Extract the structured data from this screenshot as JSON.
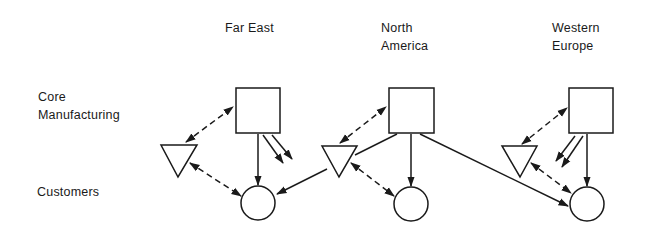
{
  "regions": [
    {
      "name": "Far East",
      "lines": [
        "Far East"
      ]
    },
    {
      "name": "North America",
      "lines": [
        "North",
        "America"
      ]
    },
    {
      "name": "Western Europe",
      "lines": [
        "Western",
        "Europe"
      ]
    }
  ],
  "row_labels": {
    "core": [
      "Core",
      "Manufacturing"
    ],
    "customers": "Customers"
  },
  "legend_shapes": {
    "square": "core-manufacturing-plant",
    "triangle": "secondary-plant",
    "circle": "customers"
  },
  "colors": {
    "stroke": "#1a1a1a",
    "background": "#ffffff"
  }
}
